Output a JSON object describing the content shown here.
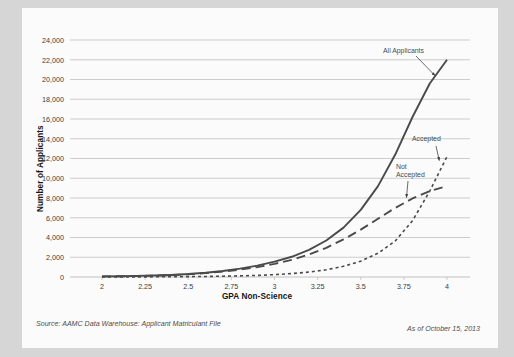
{
  "chart_data": {
    "type": "line",
    "title": "",
    "xlabel": "GPA Non-Science",
    "ylabel": "Number of Applicants",
    "xlim": [
      2,
      4
    ],
    "ylim": [
      0,
      24000
    ],
    "grid": true,
    "legend_position": "inline-annotations",
    "x_ticks": [
      "2",
      "2.25",
      "2.5",
      "2.75",
      "3",
      "3.25",
      "3.5",
      "3.75",
      "4"
    ],
    "x_tick_values": [
      2,
      2.25,
      2.5,
      2.75,
      3,
      3.25,
      3.5,
      3.75,
      4
    ],
    "y_ticks": [
      "0",
      "2,000",
      "4,000",
      "6,000",
      "8,000",
      "10,000",
      "12,000",
      "14,000",
      "16,000",
      "18,000",
      "20,000",
      "22,000",
      "24,000"
    ],
    "y_tick_values": [
      0,
      2000,
      4000,
      6000,
      8000,
      10000,
      12000,
      14000,
      16000,
      18000,
      20000,
      22000,
      24000
    ],
    "x": [
      2,
      2.1,
      2.2,
      2.3,
      2.4,
      2.5,
      2.6,
      2.7,
      2.8,
      2.9,
      3,
      3.1,
      3.2,
      3.3,
      3.4,
      3.5,
      3.6,
      3.7,
      3.8,
      3.9,
      4
    ],
    "series": [
      {
        "name": "All Applicants",
        "style": "solid",
        "color": "#4a4a4a",
        "values": [
          60,
          80,
          110,
          150,
          210,
          300,
          430,
          610,
          850,
          1150,
          1550,
          2050,
          2750,
          3700,
          5000,
          6800,
          9200,
          12400,
          16200,
          19600,
          22000
        ]
      },
      {
        "name": "Not Accepted",
        "style": "long-dash",
        "color": "#4a4a4a",
        "values": [
          55,
          75,
          100,
          140,
          195,
          275,
          390,
          545,
          750,
          1000,
          1330,
          1740,
          2280,
          2960,
          3800,
          4800,
          5900,
          7000,
          7950,
          8700,
          9200
        ]
      },
      {
        "name": "Accepted",
        "style": "short-dash",
        "color": "#4a4a4a",
        "values": [
          5,
          8,
          12,
          18,
          26,
          38,
          55,
          80,
          115,
          165,
          240,
          345,
          500,
          730,
          1080,
          1600,
          2400,
          3650,
          5700,
          8700,
          12200
        ]
      }
    ],
    "annotations": [
      {
        "text": "All Applicants",
        "target_x": 3.93,
        "target_y": 20400
      },
      {
        "text": "Accepted",
        "target_x": 3.95,
        "target_y": 11800
      },
      {
        "text": "Not Accepted",
        "target_x": 3.76,
        "target_y": 8050
      }
    ]
  },
  "annotations": {
    "all_applicants": "All Applicants",
    "accepted": "Accepted",
    "not_accepted_line1": "Not",
    "not_accepted_line2": "Accepted"
  },
  "axes": {
    "y_title": "Number of Applicants",
    "x_title": "GPA Non-Science"
  },
  "footer": {
    "source": "Source: AAMC Data Warehouse: Applicant Matriculant File",
    "date": "As of October 15, 2013"
  },
  "colors": {
    "background": "#d6d6d6",
    "card": "#fbfbfb",
    "gridline": "#b9b9b9",
    "curve": "#4a4a4a",
    "text": "#3b3b3b"
  }
}
